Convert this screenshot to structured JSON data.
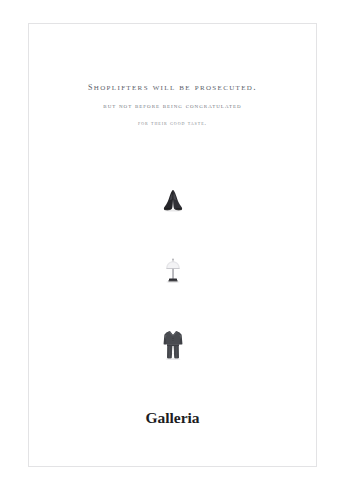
{
  "poster": {
    "background_color": "#ffffff",
    "frame_color": "#e3e3e5"
  },
  "headline": {
    "line1": "Shoplifters will be prosecuted.",
    "line2": "But not before being congratulated",
    "line3": "for their good taste.",
    "line1_color": "#5c5f6b",
    "line2_color": "#74777f",
    "line3_color": "#83868d"
  },
  "products": [
    {
      "name": "shoes",
      "icon": "shoes-photo",
      "description": "pair of dark dress shoes, top view",
      "color": "#2e2e32"
    },
    {
      "name": "lamp",
      "icon": "table-lamp-photo",
      "description": "table lamp with pale shade and dark base",
      "color": "#cfcfd3"
    },
    {
      "name": "suit",
      "icon": "suit-photo",
      "description": "dark gray suit with jacket and trousers",
      "color": "#44464b"
    }
  ],
  "brand": {
    "name": "Galleria",
    "name_color": "#1d1d1f",
    "tagline": "",
    "tagline_color": "#a9abb0"
  }
}
